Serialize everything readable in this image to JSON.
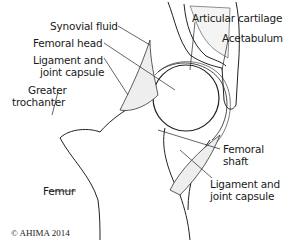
{
  "diagram": {
    "labels": {
      "synovial_fluid": "Synovial fluid",
      "femoral_head": "Femoral head",
      "ligament_capsule_1a": "Ligament and",
      "ligament_capsule_1b": "joint capsule",
      "greater_trochanter_a": "Greater",
      "greater_trochanter_b": "trochanter",
      "femur": "Femur",
      "articular_cartilage": "Articular cartilage",
      "acetabulum": "Acetabulum",
      "femoral_shaft_a": "Femoral",
      "femoral_shaft_b": "shaft",
      "ligament_capsule_2a": "Ligament and",
      "ligament_capsule_2b": "joint capsule"
    },
    "copyright": "© AHIMA 2014"
  }
}
